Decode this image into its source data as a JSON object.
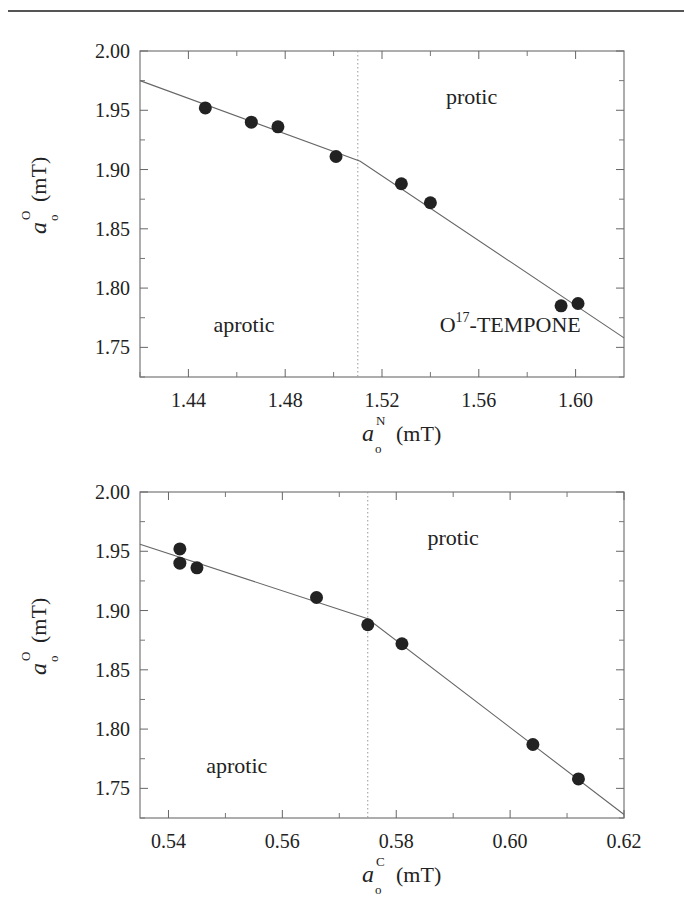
{
  "page": {
    "header_rule": true
  },
  "chart_data": [
    {
      "type": "scatter",
      "id": "top",
      "title": "",
      "xlabel": "a_o^N (mT)",
      "xlabel_main": "a",
      "xlabel_sup": "N",
      "xlabel_sub": "o",
      "xlabel_unit": "(mT)",
      "ylabel": "a_o^O (mT)",
      "ylabel_main": "a",
      "ylabel_sup": "O",
      "ylabel_sub": "o",
      "ylabel_unit": "(mT)",
      "xlim": [
        1.42,
        1.62
      ],
      "ylim": [
        1.725,
        2.0
      ],
      "xticks": [
        1.44,
        1.48,
        1.52,
        1.56,
        1.6
      ],
      "xtick_labels": [
        "1.44",
        "1.48",
        "1.52",
        "1.56",
        "1.60"
      ],
      "yticks": [
        1.75,
        1.8,
        1.85,
        1.9,
        1.95,
        2.0
      ],
      "ytick_labels": [
        "1.75",
        "1.80",
        "1.85",
        "1.90",
        "1.95",
        "2.00"
      ],
      "grid": false,
      "series": [
        {
          "name": "data",
          "marker": "filled-circle",
          "x": [
            1.447,
            1.466,
            1.477,
            1.501,
            1.528,
            1.54,
            1.594,
            1.601
          ],
          "y": [
            1.952,
            1.94,
            1.936,
            1.911,
            1.888,
            1.872,
            1.785,
            1.787
          ]
        },
        {
          "name": "fit",
          "type": "line",
          "x": [
            1.42,
            1.511,
            1.62
          ],
          "y": [
            1.975,
            1.907,
            1.758
          ]
        }
      ],
      "vline": {
        "x": 1.51,
        "style": "dotted"
      },
      "annotations": [
        {
          "text": "protic",
          "x": 1.557,
          "y": 1.955
        },
        {
          "text": "aprotic",
          "x": 1.463,
          "y": 1.763
        },
        {
          "text_main": "O",
          "text_sup": "17",
          "text_rest": "-TEMPONE",
          "x": 1.573,
          "y": 1.763
        }
      ]
    },
    {
      "type": "scatter",
      "id": "bottom",
      "title": "",
      "xlabel": "a_o^C (mT)",
      "xlabel_main": "a",
      "xlabel_sup": "C",
      "xlabel_sub": "o",
      "xlabel_unit": "(mT)",
      "ylabel": "a_o^O (mT)",
      "ylabel_main": "a",
      "ylabel_sup": "O",
      "ylabel_sub": "o",
      "ylabel_unit": "(mT)",
      "xlim": [
        0.535,
        0.62
      ],
      "ylim": [
        1.725,
        2.0
      ],
      "xticks": [
        0.54,
        0.56,
        0.58,
        0.6,
        0.62
      ],
      "xtick_labels": [
        "0.54",
        "0.56",
        "0.58",
        "0.60",
        "0.62"
      ],
      "yticks": [
        1.75,
        1.8,
        1.85,
        1.9,
        1.95,
        2.0
      ],
      "ytick_labels": [
        "1.75",
        "1.80",
        "1.85",
        "1.90",
        "1.95",
        "2.00"
      ],
      "grid": false,
      "series": [
        {
          "name": "data",
          "marker": "filled-circle",
          "x": [
            0.542,
            0.542,
            0.545,
            0.566,
            0.575,
            0.581,
            0.604,
            0.612
          ],
          "y": [
            1.952,
            1.94,
            1.936,
            1.911,
            1.888,
            1.872,
            1.787,
            1.758
          ]
        },
        {
          "name": "fit",
          "type": "line",
          "x": [
            0.535,
            0.575,
            0.62
          ],
          "y": [
            1.956,
            1.893,
            1.728
          ]
        }
      ],
      "vline": {
        "x": 0.575,
        "style": "dotted"
      },
      "annotations": [
        {
          "text": "protic",
          "x": 0.59,
          "y": 1.955
        },
        {
          "text": "aprotic",
          "x": 0.552,
          "y": 1.763
        }
      ]
    }
  ]
}
